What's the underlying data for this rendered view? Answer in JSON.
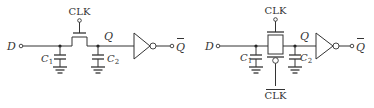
{
  "diagrams": [
    {
      "name": "nmos-pass-transistor-latch",
      "input_label": "D",
      "clock_label": "CLK",
      "cap1_label": "C",
      "cap1_sub": "1",
      "cap2_label": "C",
      "cap2_sub": "2",
      "node_label": "Q",
      "output_label": "Q"
    },
    {
      "name": "transmission-gate-latch",
      "input_label": "D",
      "clock_label": "CLK",
      "clock_bar_label": "CLK",
      "cap1_label": "C",
      "cap1_sub": "1",
      "cap2_label": "C",
      "cap2_sub": "2",
      "node_label": "Q",
      "output_label": "Q"
    }
  ]
}
